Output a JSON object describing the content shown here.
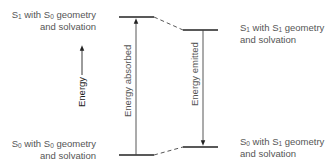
{
  "diagram": {
    "type": "energy-level diagram",
    "levels": [
      {
        "id": "s1_s0geom",
        "state": "S",
        "state_sub": "1",
        "line1_mid": " with S",
        "geom_sub": "0",
        "line1_end": " geometry",
        "line2": "and solvation",
        "position": "top-left"
      },
      {
        "id": "s1_s1geom",
        "state": "S",
        "state_sub": "1",
        "line1_mid": " with S",
        "geom_sub": "1",
        "line1_end": " geometry",
        "line2": "and solvation",
        "position": "upper-right"
      },
      {
        "id": "s0_s0geom",
        "state": "S",
        "state_sub": "0",
        "line1_mid": " with S",
        "geom_sub": "0",
        "line1_end": " geometry",
        "line2": "and solvation",
        "position": "bottom-left"
      },
      {
        "id": "s0_s1geom",
        "state": "S",
        "state_sub": "0",
        "line1_mid": " with S",
        "geom_sub": "1",
        "line1_end": " geometry",
        "line2": "and solvation",
        "position": "lower-right"
      }
    ],
    "transitions": [
      {
        "label": "Energy absorbed",
        "from": "s0_s0geom",
        "to": "s1_s0geom",
        "direction": "up"
      },
      {
        "label": "Energy emitted",
        "from": "s1_s1geom",
        "to": "s0_s1geom",
        "direction": "down"
      }
    ],
    "relaxations": [
      {
        "from": "s1_s0geom",
        "to": "s1_s1geom",
        "style": "dashed"
      },
      {
        "from": "s0_s1geom",
        "to": "s0_s0geom",
        "style": "dashed"
      }
    ],
    "axis": {
      "label": "Energy",
      "direction": "up"
    },
    "colors": {
      "line": "#222222",
      "text": "#555555"
    }
  }
}
